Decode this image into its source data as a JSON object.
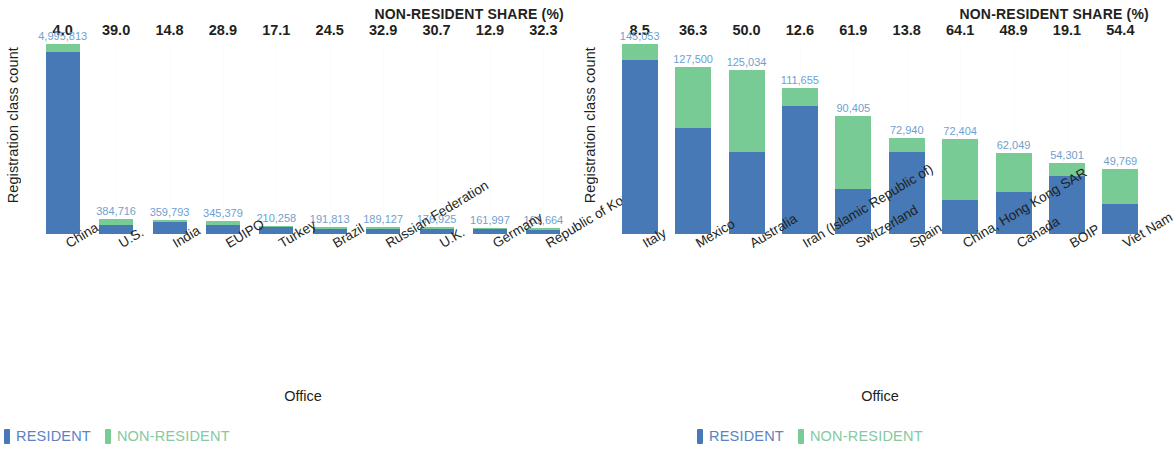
{
  "colors": {
    "resident": "#4679b5",
    "non_resident": "#79cb96",
    "value_label": "#6f9fd0",
    "text": "#231f20"
  },
  "panels": [
    {
      "share_header": "NON-RESIDENT SHARE (%)",
      "y_axis_title": "Registration class count",
      "x_axis_title": "Office",
      "legend": [
        {
          "label": "RESIDENT",
          "swatch": "resident"
        },
        {
          "label": "NON-RESIDENT",
          "swatch": "non_resident"
        }
      ]
    },
    {
      "share_header": "NON-RESIDENT SHARE (%)",
      "y_axis_title": "Registration class count",
      "x_axis_title": "Office",
      "legend": [
        {
          "label": "RESIDENT",
          "swatch": "resident"
        },
        {
          "label": "NON-RESIDENT",
          "swatch": "non_resident"
        }
      ]
    }
  ],
  "chart_data": [
    {
      "type": "bar",
      "subtype": "stacked-vertical",
      "title": "NON-RESIDENT SHARE (%)",
      "xlabel": "Office",
      "ylabel": "Registration class count",
      "grid": "faint-vertical",
      "legend_position": "bottom-left",
      "ylim": [
        0,
        4995813
      ],
      "categories": [
        "China",
        "U.S.",
        "India",
        "EUIPO",
        "Turkey",
        "Brazil",
        "Russian Federation",
        "U.K.",
        "Germany",
        "Republic of Korea"
      ],
      "totals": [
        4995813,
        384716,
        359793,
        345379,
        210258,
        191813,
        189127,
        176925,
        161997,
        161664
      ],
      "total_labels": [
        "4,995,813",
        "384,716",
        "359,793",
        "345,379",
        "210,258",
        "191,813",
        "189,127",
        "176,925",
        "161,997",
        "161,664"
      ],
      "non_resident_share_pct": [
        4.0,
        39.0,
        14.8,
        28.9,
        17.1,
        24.5,
        32.9,
        30.7,
        12.9,
        32.3
      ],
      "non_resident_share_labels": [
        "4.0",
        "39.0",
        "14.8",
        "28.9",
        "17.1",
        "24.5",
        "32.9",
        "30.7",
        "12.9",
        "32.3"
      ],
      "series": [
        {
          "name": "RESIDENT",
          "color": "#4679b5",
          "values": [
            4795980,
            234677,
            306543,
            245564,
            174304,
            144819,
            126904,
            122609,
            141099,
            109447
          ]
        },
        {
          "name": "NON-RESIDENT",
          "color": "#79cb96",
          "values": [
            199833,
            150039,
            53250,
            99815,
            35954,
            46994,
            62223,
            54316,
            20898,
            52217
          ]
        }
      ]
    },
    {
      "type": "bar",
      "subtype": "stacked-vertical",
      "title": "NON-RESIDENT SHARE (%)",
      "xlabel": "Office",
      "ylabel": "Registration class count",
      "grid": "faint-vertical",
      "legend_position": "bottom-left",
      "ylim": [
        0,
        145053
      ],
      "categories": [
        "Italy",
        "Mexico",
        "Australia",
        "Iran (Islamic Republic of)",
        "Switzerland",
        "Spain",
        "China, Hong Kong SAR",
        "Canada",
        "BOIP",
        "Viet Nam"
      ],
      "totals": [
        145053,
        127500,
        125034,
        111655,
        90405,
        72940,
        72404,
        62049,
        54301,
        49769
      ],
      "total_labels": [
        "145,053",
        "127,500",
        "125,034",
        "111,655",
        "90,405",
        "72,940",
        "72,404",
        "62,049",
        "54,301",
        "49,769"
      ],
      "non_resident_share_pct": [
        8.5,
        36.3,
        50.0,
        12.6,
        61.9,
        13.8,
        64.1,
        48.9,
        19.1,
        54.4
      ],
      "non_resident_share_labels": [
        "8.5",
        "36.3",
        "50.0",
        "12.6",
        "61.9",
        "13.8",
        "64.1",
        "48.9",
        "19.1",
        "54.4"
      ],
      "series": [
        {
          "name": "RESIDENT",
          "color": "#4679b5",
          "values": [
            132723,
            81217,
            62517,
            97586,
            34444,
            62874,
            25993,
            31707,
            43930,
            22695
          ]
        },
        {
          "name": "NON-RESIDENT",
          "color": "#79cb96",
          "values": [
            12330,
            46283,
            62517,
            14069,
            55961,
            10066,
            46411,
            30342,
            10371,
            27074
          ]
        }
      ]
    }
  ]
}
